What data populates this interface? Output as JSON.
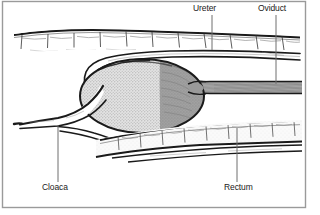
{
  "figure": {
    "background_color": "#ffffff",
    "frame_color": "#9a9a9a",
    "ink_color": "#1a1a1a"
  },
  "labels": [
    {
      "id": "ureter",
      "text": "Ureter",
      "text_x": 193,
      "text_y": 11,
      "leader_x": 212,
      "leader_y1": 15,
      "leader_y2": 50
    },
    {
      "id": "oviduct",
      "text": "Oviduct",
      "text_x": 258,
      "text_y": 11,
      "leader_x": 276,
      "leader_y1": 15,
      "leader_y2": 84
    },
    {
      "id": "cloaca",
      "text": "Cloaca",
      "text_x": 42,
      "text_y": 190,
      "leader_x": 58,
      "leader_y1": 125,
      "leader_y2": 182
    },
    {
      "id": "rectum",
      "text": "Rectum",
      "text_x": 224,
      "text_y": 190,
      "leader_x": 237,
      "leader_y1": 128,
      "leader_y2": 182
    }
  ],
  "structures": {
    "body_wall_label": "segmented body wall",
    "egg_label": "egg in shell gland",
    "egg_light_fill": "#d9d9d9",
    "egg_dark_fill": "#9e9e9e",
    "oviduct_band_fill": "#9a9a9a",
    "rectum_fill": "#f2f2f2"
  },
  "colors": {
    "ink": "#1a1a1a",
    "leader": "#6e6e6e",
    "frame": "#9a9a9a",
    "light_gray": "#d9d9d9",
    "mid_gray": "#9e9e9e",
    "dark_gray": "#7a7a7a"
  }
}
